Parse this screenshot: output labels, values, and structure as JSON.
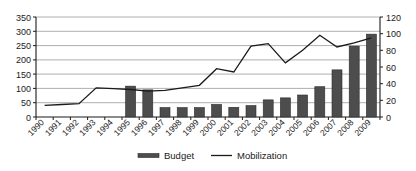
{
  "chart_data": {
    "type": "bar",
    "title": "",
    "subtitle": "",
    "xlabel": "",
    "ylabel": "",
    "y2label": "",
    "categories": [
      "1990",
      "1991",
      "1992",
      "1993",
      "1994",
      "1995",
      "1996",
      "1997",
      "1998",
      "1999",
      "2000",
      "2001",
      "2002",
      "2003",
      "2004",
      "2005",
      "2006",
      "2007",
      "2008",
      "2009"
    ],
    "series": [
      {
        "name": "Budget",
        "type": "bar",
        "axis": "left",
        "color": "#4d4d4d",
        "values": [
          null,
          null,
          null,
          null,
          null,
          108,
          95,
          33,
          33,
          33,
          44,
          34,
          40,
          60,
          67,
          77,
          106,
          165,
          248,
          290
        ]
      },
      {
        "name": "Mobilization",
        "type": "line",
        "axis": "right",
        "color": "#1a1a1a",
        "values": [
          14,
          15,
          16,
          35,
          34,
          33,
          31,
          32,
          35,
          38,
          58,
          54,
          85,
          88,
          65,
          80,
          98,
          84,
          89,
          95
        ]
      }
    ],
    "ylim": [
      0,
      350
    ],
    "yticks": [
      0,
      50,
      100,
      150,
      200,
      250,
      300,
      350
    ],
    "y2lim": [
      0,
      120
    ],
    "y2ticks": [
      0,
      20,
      40,
      60,
      80,
      100,
      120
    ],
    "grid": true,
    "legend_position": "bottom",
    "legend": [
      {
        "label": "Budget",
        "marker": "bar-swatch"
      },
      {
        "label": "Mobilization",
        "marker": "line-swatch"
      }
    ]
  },
  "axes": {
    "left_tick_labels": [
      "350",
      "300",
      "250",
      "200",
      "150",
      "100",
      "50",
      "0"
    ],
    "right_tick_labels": [
      "120",
      "100",
      "80",
      "60",
      "40",
      "20",
      "0"
    ],
    "x_tick_labels": [
      "1990",
      "1991",
      "1992",
      "1993",
      "1994",
      "1995",
      "1996",
      "1997",
      "1998",
      "1999",
      "2000",
      "2001",
      "2002",
      "2003",
      "2004",
      "2005",
      "2006",
      "2007",
      "2008",
      "2009"
    ]
  },
  "legend": {
    "budget_label": "Budget",
    "mobilization_label": "Mobilization"
  }
}
